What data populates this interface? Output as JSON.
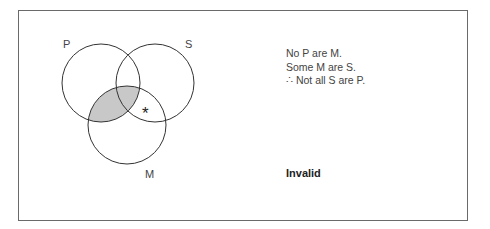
{
  "diagram": {
    "type": "venn",
    "circles": [
      {
        "label": "P",
        "cx": 101,
        "cy": 83,
        "r": 39
      },
      {
        "label": "S",
        "cx": 155,
        "cy": 83,
        "r": 39
      },
      {
        "label": "M",
        "cx": 127,
        "cy": 125,
        "r": 39
      }
    ],
    "shaded_region": "P ∩ M",
    "shade_color": "#c8c8c8",
    "mark": {
      "symbol": "*",
      "region": "S ∩ M outside P"
    }
  },
  "labels": {
    "p": "P",
    "s": "S",
    "m": "M",
    "mark": "*"
  },
  "argument": {
    "premise1": "No P are M.",
    "premise2": "Some M are S.",
    "conclusion": "∴ Not all S are P."
  },
  "verdict": "Invalid"
}
